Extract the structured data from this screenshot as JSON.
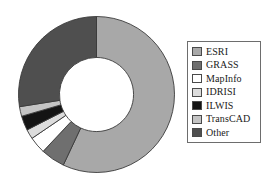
{
  "chart_data": {
    "type": "pie",
    "variant": "donut",
    "title": "",
    "subtitle": "",
    "xlabel": "",
    "ylabel": "",
    "legend_position": "right",
    "grid": false,
    "start_angle_deg": 0,
    "direction": "clockwise",
    "inner_radius_ratio": 0.475,
    "categories": [
      "ESRI",
      "GRASS",
      "MapInfo",
      "IDRISI",
      "ILWIS",
      "TransCAD",
      "Other"
    ],
    "values": [
      57,
      5,
      3.5,
      2,
      3,
      2,
      27.5
    ],
    "unit": "percent",
    "slices": [
      {
        "label": "ESRI",
        "value": 57,
        "color": "#a8a8a8",
        "start_deg": 0,
        "end_deg": 205.2
      },
      {
        "label": "GRASS",
        "value": 5,
        "color": "#6f6f6f",
        "start_deg": 205.2,
        "end_deg": 223.2
      },
      {
        "label": "MapInfo",
        "value": 3.5,
        "color": "#ffffff",
        "start_deg": 223.2,
        "end_deg": 235.8
      },
      {
        "label": "IDRISI",
        "value": 2,
        "color": "#dcdcdc",
        "start_deg": 235.8,
        "end_deg": 243.0
      },
      {
        "label": "ILWIS",
        "value": 3,
        "color": "#141414",
        "start_deg": 243.0,
        "end_deg": 253.8
      },
      {
        "label": "TransCAD",
        "value": 2,
        "color": "#c4c4c4",
        "start_deg": 253.8,
        "end_deg": 261.0
      },
      {
        "label": "Other",
        "value": 27.5,
        "color": "#4f4f4f",
        "start_deg": 261.0,
        "end_deg": 360.0
      }
    ]
  },
  "legend": {
    "border_color": "#6d6d6d",
    "items": [
      {
        "label": "ESRI",
        "color": "#a8a8a8"
      },
      {
        "label": "GRASS",
        "color": "#6f6f6f"
      },
      {
        "label": "MapInfo",
        "color": "#ffffff"
      },
      {
        "label": "IDRISI",
        "color": "#dcdcdc"
      },
      {
        "label": "ILWIS",
        "color": "#141414"
      },
      {
        "label": "TransCAD",
        "color": "#c4c4c4"
      },
      {
        "label": "Other",
        "color": "#4f4f4f"
      }
    ]
  }
}
